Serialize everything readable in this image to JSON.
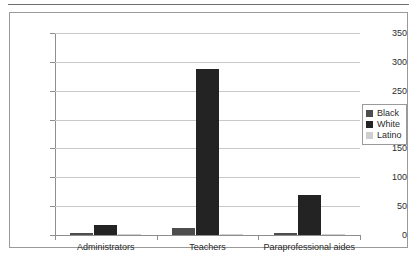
{
  "chart_data": {
    "type": "bar",
    "title": "",
    "subtitle": "",
    "xlabel": "",
    "ylabel": "",
    "categories": [
      "Administrators",
      "Teachers",
      "Paraprofessional aides"
    ],
    "series": [
      {
        "name": "Black",
        "color": "#4d4d4d",
        "values": [
          4,
          12,
          3
        ]
      },
      {
        "name": "White",
        "color": "#232323",
        "values": [
          17,
          288,
          70
        ]
      },
      {
        "name": "Latino",
        "color": "#cfcfcf",
        "values": [
          0,
          2,
          1
        ]
      }
    ],
    "ylim": [
      0,
      350
    ],
    "yticks": [
      0,
      50,
      100,
      150,
      200,
      250,
      300,
      350
    ],
    "ytick_labels": [
      "0",
      "50",
      "100",
      "150",
      "200",
      "250",
      "300",
      "350"
    ],
    "grid": true,
    "legend_position": "right"
  },
  "legend": {
    "entries": [
      {
        "label": "Black"
      },
      {
        "label": "White"
      },
      {
        "label": "Latino"
      }
    ]
  }
}
